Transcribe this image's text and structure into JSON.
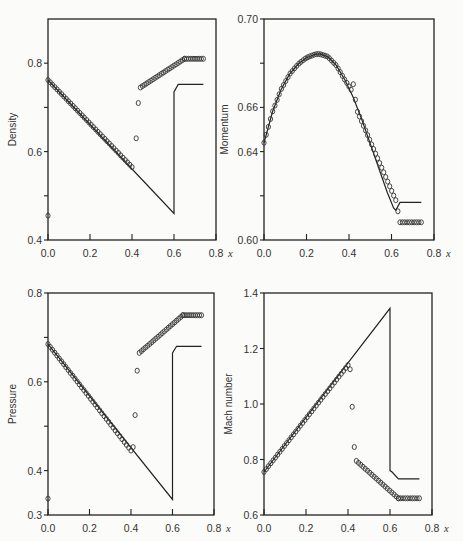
{
  "figure": {
    "panels_count": 4,
    "x_variable": "x"
  },
  "chart_data": [
    {
      "type": "line",
      "id": "density",
      "title": "",
      "xlabel": "x",
      "ylabel": "Density",
      "xlim": [
        0.0,
        0.8
      ],
      "ylim": [
        0.4,
        0.9
      ],
      "xticks": [
        "0.0",
        "0.2",
        "0.4",
        "0.6",
        "0.8"
      ],
      "yticks": [
        {
          "v": 0.4,
          "label": "0.4"
        },
        {
          "v": 0.5,
          "label": ""
        },
        {
          "v": 0.6,
          "label": "0.6"
        },
        {
          "v": 0.7,
          "label": ""
        },
        {
          "v": 0.8,
          "label": "0.8"
        }
      ],
      "grid": false,
      "box": {
        "left": 48,
        "right": 216,
        "top": 19,
        "bottom": 240
      },
      "series": [
        {
          "name": "exact solution",
          "style": "line",
          "x": [
            0.0,
            0.6,
            0.6,
            0.62,
            0.74
          ],
          "y": [
            0.762,
            0.46,
            0.735,
            0.752,
            0.752
          ]
        },
        {
          "name": "numerical solution",
          "style": "markers",
          "segments": [
            {
              "x0": 0.0,
              "x1": 0.4,
              "y0": 0.762,
              "y1": 0.565,
              "n": 38
            },
            {
              "x0": 0.44,
              "x1": 0.65,
              "y0": 0.745,
              "y1": 0.81,
              "n": 22
            },
            {
              "x0": 0.65,
              "x1": 0.74,
              "y0": 0.81,
              "y1": 0.81,
              "n": 10
            }
          ],
          "points": [
            {
              "x": 0.0,
              "y": 0.455
            },
            {
              "x": 0.42,
              "y": 0.63
            },
            {
              "x": 0.43,
              "y": 0.71
            }
          ]
        }
      ]
    },
    {
      "type": "line",
      "id": "momentum",
      "title": "",
      "xlabel": "x",
      "ylabel": "Momentum",
      "xlim": [
        0.0,
        0.8
      ],
      "ylim": [
        0.6,
        0.7
      ],
      "xticks": [
        "0.0",
        "0.2",
        "0.4",
        "0.6",
        "0.8"
      ],
      "yticks": [
        {
          "v": 0.6,
          "label": "0.60"
        },
        {
          "v": 0.62,
          "label": ""
        },
        {
          "v": 0.64,
          "label": "0.64"
        },
        {
          "v": 0.66,
          "label": "0.66"
        },
        {
          "v": 0.68,
          "label": ""
        },
        {
          "v": 0.7,
          "label": "0.70"
        }
      ],
      "grid": false,
      "box": {
        "left": 264,
        "right": 434,
        "top": 19,
        "bottom": 240
      },
      "series": [
        {
          "name": "exact solution",
          "style": "line",
          "x": [
            0.0,
            0.04,
            0.08,
            0.12,
            0.16,
            0.2,
            0.24,
            0.26,
            0.3,
            0.34,
            0.38,
            0.42,
            0.46,
            0.5,
            0.54,
            0.58,
            0.61,
            0.62,
            0.64,
            0.74
          ],
          "y": [
            0.644,
            0.658,
            0.668,
            0.675,
            0.6795,
            0.6825,
            0.684,
            0.6842,
            0.683,
            0.679,
            0.6725,
            0.6645,
            0.6545,
            0.6435,
            0.6325,
            0.6215,
            0.6145,
            0.6135,
            0.617,
            0.617
          ]
        },
        {
          "name": "numerical solution",
          "style": "markers",
          "curve_x": [
            0.0,
            0.04,
            0.08,
            0.12,
            0.16,
            0.2,
            0.24,
            0.26,
            0.3,
            0.34,
            0.38,
            0.41
          ],
          "curve_y": [
            0.644,
            0.658,
            0.668,
            0.675,
            0.6795,
            0.6825,
            0.684,
            0.6842,
            0.683,
            0.679,
            0.6725,
            0.668
          ],
          "segments": [
            {
              "x0": 0.44,
              "x1": 0.62,
              "y0": 0.658,
              "y1": 0.618,
              "n": 20
            },
            {
              "x0": 0.64,
              "x1": 0.74,
              "y0": 0.608,
              "y1": 0.608,
              "n": 10
            }
          ],
          "points": [
            {
              "x": 0.42,
              "y": 0.6705
            },
            {
              "x": 0.43,
              "y": 0.6635
            },
            {
              "x": 0.63,
              "y": 0.613
            }
          ]
        }
      ]
    },
    {
      "type": "line",
      "id": "pressure",
      "title": "",
      "xlabel": "x",
      "ylabel": "Pressure",
      "xlim": [
        0.0,
        0.8
      ],
      "ylim": [
        0.3,
        0.8
      ],
      "xticks": [
        "0.0",
        "0.2",
        "0.4",
        "0.6",
        "0.8"
      ],
      "yticks": [
        {
          "v": 0.3,
          "label": "0.3"
        },
        {
          "v": 0.4,
          "label": "0.4"
        },
        {
          "v": 0.5,
          "label": ""
        },
        {
          "v": 0.6,
          "label": "0.6"
        },
        {
          "v": 0.7,
          "label": ""
        },
        {
          "v": 0.8,
          "label": "0.8"
        }
      ],
      "grid": false,
      "box": {
        "left": 48,
        "right": 214,
        "top": 293,
        "bottom": 515
      },
      "series": [
        {
          "name": "exact solution",
          "style": "line",
          "x": [
            0.0,
            0.6,
            0.6,
            0.62,
            0.74
          ],
          "y": [
            0.685,
            0.335,
            0.665,
            0.68,
            0.68
          ]
        },
        {
          "name": "numerical solution",
          "style": "markers",
          "segments": [
            {
              "x0": 0.0,
              "x1": 0.4,
              "y0": 0.685,
              "y1": 0.445,
              "n": 38
            },
            {
              "x0": 0.44,
              "x1": 0.65,
              "y0": 0.665,
              "y1": 0.75,
              "n": 22
            },
            {
              "x0": 0.65,
              "x1": 0.74,
              "y0": 0.75,
              "y1": 0.75,
              "n": 10
            }
          ],
          "points": [
            {
              "x": 0.0,
              "y": 0.337
            },
            {
              "x": 0.41,
              "y": 0.453
            },
            {
              "x": 0.42,
              "y": 0.525
            },
            {
              "x": 0.43,
              "y": 0.625
            }
          ]
        }
      ]
    },
    {
      "type": "line",
      "id": "mach",
      "title": "",
      "xlabel": "x",
      "ylabel": "Mach number",
      "xlim": [
        0.0,
        0.8
      ],
      "ylim": [
        0.6,
        1.4
      ],
      "xticks": [
        "0.0",
        "0.2",
        "0.4",
        "0.6",
        "0.8"
      ],
      "yticks": [
        {
          "v": 0.6,
          "label": "0.6"
        },
        {
          "v": 0.8,
          "label": "0.8"
        },
        {
          "v": 1.0,
          "label": "1.0"
        },
        {
          "v": 1.2,
          "label": "1.2"
        },
        {
          "v": 1.4,
          "label": "1.4"
        }
      ],
      "grid": false,
      "box": {
        "left": 264,
        "right": 432,
        "top": 293,
        "bottom": 515
      },
      "series": [
        {
          "name": "exact solution",
          "style": "line",
          "x": [
            0.0,
            0.6,
            0.6,
            0.61,
            0.64,
            0.74
          ],
          "y": [
            0.755,
            1.345,
            0.76,
            0.755,
            0.73,
            0.73
          ]
        },
        {
          "name": "numerical solution",
          "style": "markers",
          "segments": [
            {
              "x0": 0.0,
              "x1": 0.4,
              "y0": 0.755,
              "y1": 1.14,
              "n": 38
            },
            {
              "x0": 0.44,
              "x1": 0.64,
              "y0": 0.795,
              "y1": 0.66,
              "n": 20
            },
            {
              "x0": 0.64,
              "x1": 0.74,
              "y0": 0.66,
              "y1": 0.66,
              "n": 10
            }
          ],
          "points": [
            {
              "x": 0.41,
              "y": 1.125
            },
            {
              "x": 0.42,
              "y": 0.99
            },
            {
              "x": 0.43,
              "y": 0.845
            }
          ]
        }
      ]
    }
  ]
}
